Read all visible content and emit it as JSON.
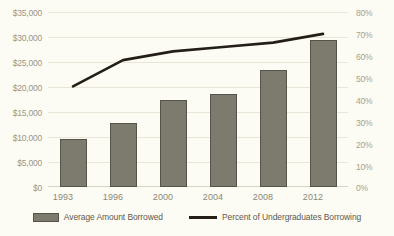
{
  "chart_data": {
    "type": "bar",
    "title": "",
    "xlabel": "",
    "ylabel": "",
    "grid": true,
    "legend_position": "bottom",
    "categories": [
      "1993",
      "1996",
      "2000",
      "2004",
      "2008",
      "2012"
    ],
    "series": [
      {
        "name": "Average Amount Borrowed",
        "type": "bar",
        "axis": "left",
        "color": "#7d7a6e",
        "values": [
          9600,
          12800,
          17400,
          18600,
          23400,
          29400
        ]
      },
      {
        "name": "Percent of Undergraduates Borrowing",
        "type": "line",
        "axis": "right",
        "color": "#231f16",
        "values": [
          46,
          58,
          62,
          64,
          66,
          70
        ]
      }
    ],
    "yaxis_left": {
      "min": 0,
      "max": 35000,
      "step": 5000,
      "ticks": [
        "$0",
        "$5,000",
        "$10,000",
        "$15,000",
        "$20,000",
        "$25,000",
        "$30,000",
        "$35,000"
      ]
    },
    "yaxis_right": {
      "min": 0,
      "max": 80,
      "step": 10,
      "ticks": [
        "0%",
        "10%",
        "20%",
        "30%",
        "40%",
        "50%",
        "60%",
        "70%",
        "80%"
      ]
    }
  },
  "axis": {
    "left_ticks": [
      {
        "label": "$35,000"
      },
      {
        "label": "$30,000"
      },
      {
        "label": "$25,000"
      },
      {
        "label": "$20,000"
      },
      {
        "label": "$15,000"
      },
      {
        "label": "$10,000"
      },
      {
        "label": "$5,000"
      },
      {
        "label": "$0"
      }
    ],
    "right_ticks": [
      {
        "label": "80%"
      },
      {
        "label": "70%"
      },
      {
        "label": "60%"
      },
      {
        "label": "50%"
      },
      {
        "label": "40%"
      },
      {
        "label": "30%"
      },
      {
        "label": "20%"
      },
      {
        "label": "10%"
      },
      {
        "label": "0%"
      }
    ],
    "x_ticks": [
      {
        "label": "1993"
      },
      {
        "label": "1996"
      },
      {
        "label": "2000"
      },
      {
        "label": "2004"
      },
      {
        "label": "2008"
      },
      {
        "label": "2012"
      }
    ]
  },
  "legend": {
    "items": [
      {
        "label": "Average Amount Borrowed",
        "marker": "bar-swatch"
      },
      {
        "label": "Percent of Undergraduates Borrowing",
        "marker": "line-swatch"
      }
    ]
  },
  "colors": {
    "background": "#fdfcf4",
    "bar_fill": "#7d7a6e",
    "bar_border": "#55534a",
    "line": "#231f16",
    "gridline": "#e9e6d8",
    "left_tick_text": "#9b9684",
    "right_tick_text": "#a9a18a",
    "x_tick_text": "#8c8876"
  }
}
